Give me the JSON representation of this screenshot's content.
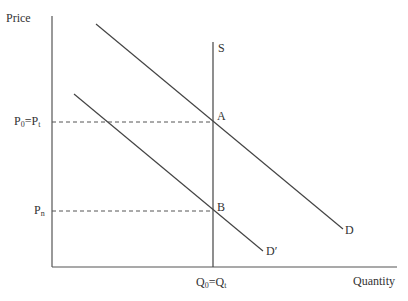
{
  "diagram": {
    "type": "supply-demand",
    "colors": {
      "axis": "#555555",
      "line": "#444444",
      "dashed": "#555555",
      "text": "#333333"
    },
    "axes": {
      "y_label": "Price",
      "x_label": "Quantity",
      "origin": [
        52,
        267
      ],
      "y_top": 16,
      "x_right": 397
    },
    "curves": [
      {
        "id": "S",
        "label": "S",
        "x1": 213,
        "y1": 42,
        "x2": 213,
        "y2": 267
      },
      {
        "id": "D",
        "label": "D",
        "x1": 96,
        "y1": 24,
        "x2": 343,
        "y2": 229
      },
      {
        "id": "D_prime",
        "label": "D′",
        "x1": 74,
        "y1": 94,
        "x2": 263,
        "y2": 251
      }
    ],
    "points": [
      {
        "id": "A",
        "label": "A",
        "x": 213,
        "y": 122
      },
      {
        "id": "B",
        "label": "B",
        "x": 213,
        "y": 211
      }
    ],
    "price_labels": [
      {
        "base": "P",
        "sub": "0",
        "eq": "=",
        "base2": "P",
        "sub2": "t",
        "y": 122
      },
      {
        "base": "P",
        "sub": "n",
        "y": 211
      }
    ],
    "quantity_label": {
      "base": "Q",
      "sub": "0",
      "eq": "=",
      "base2": "Q",
      "sub2": "t",
      "x": 213
    }
  }
}
